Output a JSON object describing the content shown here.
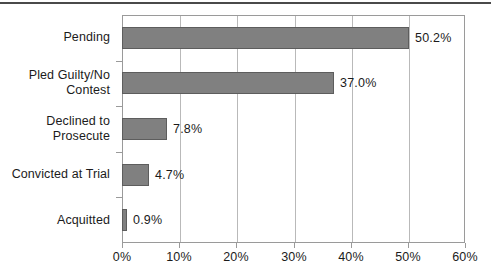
{
  "chart_data": {
    "type": "bar",
    "orientation": "horizontal",
    "title": "",
    "subtitle": "",
    "xlabel": "",
    "ylabel": "",
    "categories": [
      "Pending",
      "Pled Guilty/No Contest",
      "Declined to Prosecute",
      "Convicted at Trial",
      "Acquitted"
    ],
    "category_lines": [
      [
        "Pending"
      ],
      [
        "Pled Guilty/No",
        "Contest"
      ],
      [
        "Declined to",
        "Prosecute"
      ],
      [
        "Convicted at Trial"
      ],
      [
        "Acquitted"
      ]
    ],
    "values": [
      50.2,
      37.0,
      7.8,
      4.7,
      0.9
    ],
    "data_labels": [
      "50.2%",
      "37.0%",
      "7.8%",
      "4.7%",
      "0.9%"
    ],
    "xlim": [
      0,
      60
    ],
    "xticks": [
      0,
      10,
      20,
      30,
      40,
      50,
      60
    ],
    "xtick_labels": [
      "0%",
      "10%",
      "20%",
      "30%",
      "40%",
      "50%",
      "60%"
    ],
    "grid": "vertical",
    "legend": "none",
    "series": [
      {
        "name": "Share of cases",
        "values": [
          50.2,
          37.0,
          7.8,
          4.7,
          0.9
        ]
      }
    ],
    "colors": {
      "bar_fill": "#808080",
      "bar_border": "#5d5d5d",
      "gridline": "#b9b9b9",
      "axis": "#9a9a9a",
      "text": "#1b1b1b",
      "background": "#ffffff",
      "top_rule": "#4a4a4a"
    }
  }
}
